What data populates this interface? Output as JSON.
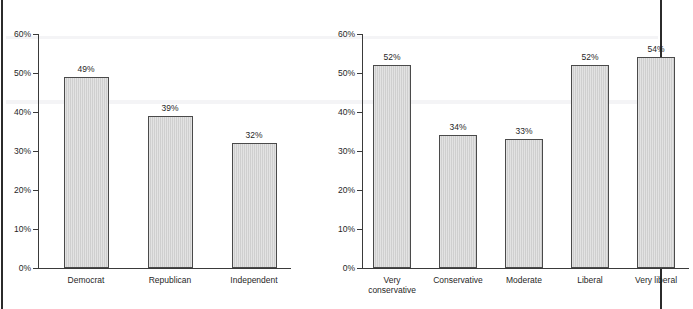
{
  "chart_data": [
    {
      "type": "bar",
      "panel": "left",
      "title": "",
      "xlabel": "",
      "ylabel": "",
      "categories": [
        "Democrat",
        "Republican",
        "Independent"
      ],
      "values": [
        49,
        39,
        32
      ],
      "value_labels": [
        "49%",
        "39%",
        "32%"
      ],
      "ylim": [
        0,
        60
      ],
      "yticks": [
        0,
        10,
        20,
        30,
        40,
        50,
        60
      ],
      "ytick_labels": [
        "0%",
        "10%",
        "20%",
        "30%",
        "40%",
        "50%",
        "60%"
      ],
      "grid": false,
      "legend": "none"
    },
    {
      "type": "bar",
      "panel": "right",
      "title": "",
      "xlabel": "",
      "ylabel": "",
      "categories": [
        "Very conservative",
        "Conservative",
        "Moderate",
        "Liberal",
        "Very liberal"
      ],
      "category_lines": [
        [
          "Very",
          "conservative"
        ],
        [
          "Conservative"
        ],
        [
          "Moderate"
        ],
        [
          "Liberal"
        ],
        [
          "Very liberal"
        ]
      ],
      "values": [
        52,
        34,
        33,
        52,
        54
      ],
      "value_labels": [
        "52%",
        "34%",
        "33%",
        "52%",
        "54%"
      ],
      "ylim": [
        0,
        60
      ],
      "yticks": [
        0,
        10,
        20,
        30,
        40,
        50,
        60
      ],
      "ytick_labels": [
        "0%",
        "10%",
        "20%",
        "30%",
        "40%",
        "50%",
        "60%"
      ],
      "grid": false,
      "legend": "none"
    }
  ],
  "colors": {
    "bar_fill": "#d4d4d4",
    "bar_stroke": "#4a4a4a",
    "axis": "#3a3a3a",
    "text": "#1f1f1f",
    "frame": "#2b2b2b",
    "background": "#ffffff"
  }
}
